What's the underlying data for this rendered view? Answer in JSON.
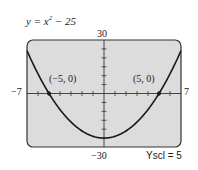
{
  "chart_data": {
    "type": "line",
    "title_parts": {
      "lhs": "y = x",
      "exp": "2",
      "rhs": " − 25"
    },
    "function": "x^2 - 25",
    "xlim": [
      -7,
      7
    ],
    "ylim": [
      -30,
      30
    ],
    "xscl": 1,
    "yscl": 5,
    "tick_labels": {
      "xmin": "−7",
      "xmax": "7",
      "ymin": "−30",
      "ymax": "30"
    },
    "annotations": [
      {
        "label": "(−5, 0)",
        "x": -5,
        "y": 0
      },
      {
        "label": "(5, 0)",
        "x": 5,
        "y": 0
      }
    ],
    "yscl_label": "Yscl = 5",
    "grid": false,
    "screen_color": "#dcdcdc",
    "curve_color": "#1a1a1a"
  }
}
